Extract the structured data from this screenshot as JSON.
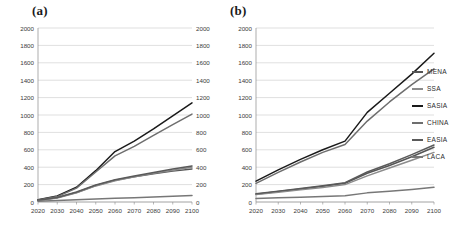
{
  "figure": {
    "panels": [
      {
        "id": "a",
        "label": "(a)"
      },
      {
        "id": "b",
        "label": "(b)"
      }
    ]
  },
  "legend": {
    "position": "right",
    "entries": [
      {
        "name": "MENA",
        "color": "#555555"
      },
      {
        "name": "SSA",
        "color": "#8c8c8c"
      },
      {
        "name": "SASIA",
        "color": "#1a1a1a"
      },
      {
        "name": "CHINA",
        "color": "#6e6e6e"
      },
      {
        "name": "EASIA",
        "color": "#5a5a5a"
      },
      {
        "name": "LACA",
        "color": "#777777"
      }
    ]
  },
  "axes": {
    "x_ticks": [
      "2020",
      "2030",
      "2040",
      "2050",
      "2060",
      "2070",
      "2080",
      "2090",
      "2100"
    ],
    "y_ticks": [
      "0",
      "200",
      "400",
      "600",
      "800",
      "1000",
      "1200",
      "1400",
      "1600",
      "1800",
      "2000"
    ]
  },
  "chart_data": [
    {
      "type": "line",
      "panel": "(a)",
      "title": "",
      "xlabel": "",
      "ylabel": "",
      "x": [
        2020,
        2030,
        2040,
        2050,
        2060,
        2070,
        2080,
        2090,
        2100
      ],
      "xlim": [
        2020,
        2100
      ],
      "ylim": [
        0,
        2000
      ],
      "ytick_step": 200,
      "grid": true,
      "legend_position": "right",
      "series": [
        {
          "name": "MENA",
          "color": "#555555",
          "values": [
            20,
            50,
            110,
            190,
            250,
            290,
            325,
            355,
            380
          ]
        },
        {
          "name": "SSA",
          "color": "#8c8c8c",
          "values": [
            18,
            45,
            105,
            185,
            245,
            290,
            330,
            365,
            400
          ]
        },
        {
          "name": "SASIA",
          "color": "#1a1a1a",
          "values": [
            25,
            70,
            170,
            360,
            580,
            700,
            840,
            990,
            1140
          ]
        },
        {
          "name": "CHINA",
          "color": "#6e6e6e",
          "values": [
            22,
            62,
            160,
            345,
            530,
            640,
            765,
            890,
            1010
          ]
        },
        {
          "name": "EASIA",
          "color": "#5a5a5a",
          "values": [
            20,
            52,
            115,
            195,
            255,
            300,
            340,
            378,
            415
          ]
        },
        {
          "name": "LACA",
          "color": "#777777",
          "values": [
            10,
            18,
            26,
            34,
            42,
            50,
            58,
            66,
            75
          ]
        }
      ]
    },
    {
      "type": "line",
      "panel": "(b)",
      "title": "",
      "xlabel": "",
      "ylabel": "",
      "x": [
        2020,
        2030,
        2040,
        2050,
        2060,
        2070,
        2080,
        2090,
        2100
      ],
      "xlim": [
        2020,
        2100
      ],
      "ylim": [
        0,
        2000
      ],
      "ytick_step": 200,
      "grid": true,
      "legend_position": "right",
      "series": [
        {
          "name": "MENA",
          "color": "#555555",
          "values": [
            90,
            120,
            150,
            180,
            215,
            330,
            420,
            520,
            630
          ]
        },
        {
          "name": "SSA",
          "color": "#8c8c8c",
          "values": [
            85,
            112,
            140,
            168,
            200,
            300,
            390,
            480,
            570
          ]
        },
        {
          "name": "SASIA",
          "color": "#1a1a1a",
          "values": [
            240,
            370,
            490,
            600,
            700,
            1030,
            1250,
            1470,
            1710
          ]
        },
        {
          "name": "CHINA",
          "color": "#6e6e6e",
          "values": [
            215,
            340,
            460,
            570,
            660,
            930,
            1150,
            1350,
            1530
          ]
        },
        {
          "name": "EASIA",
          "color": "#5a5a5a",
          "values": [
            95,
            125,
            155,
            188,
            222,
            345,
            440,
            545,
            655
          ]
        },
        {
          "name": "LACA",
          "color": "#777777",
          "values": [
            40,
            48,
            56,
            64,
            72,
            105,
            125,
            145,
            170
          ]
        }
      ]
    }
  ]
}
